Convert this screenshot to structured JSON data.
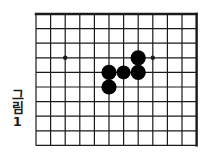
{
  "figure": {
    "caption": "그림1",
    "caption_label": "그림 1",
    "kind": "go-board-diagram",
    "background_color": "#ffffff",
    "line_color": "#1a1a1a",
    "stone_color": "#000000"
  },
  "board": {
    "origin_x": 36,
    "origin_y": 14,
    "cell_size_x": 14.6,
    "cell_size_y": 14.6,
    "columns": 12,
    "rows": 10,
    "grid_line_width": 1.2,
    "border_line_width": 2.4,
    "border_edges": [
      "top",
      "right"
    ],
    "column_indices": [
      0,
      1,
      2,
      3,
      4,
      5,
      6,
      7,
      8,
      9,
      10,
      11
    ],
    "row_indices": [
      0,
      1,
      2,
      3,
      4,
      5,
      6,
      7,
      8,
      9
    ]
  },
  "star_points": [
    {
      "name": "star-point-left",
      "col": 2,
      "row": 3,
      "radius": 2.2
    },
    {
      "name": "star-point-right",
      "col": 8,
      "row": 3,
      "radius": 2.2
    }
  ],
  "stones": [
    {
      "name": "stone-1",
      "color": "black",
      "col": 7,
      "row": 3,
      "radius": 7.6
    },
    {
      "name": "stone-2",
      "color": "black",
      "col": 5,
      "row": 4,
      "radius": 7.6
    },
    {
      "name": "stone-3",
      "color": "black",
      "col": 6,
      "row": 4,
      "radius": 7.0
    },
    {
      "name": "stone-4",
      "color": "black",
      "col": 7,
      "row": 4,
      "radius": 7.6
    },
    {
      "name": "stone-5",
      "color": "black",
      "col": 5,
      "row": 5,
      "radius": 7.6
    }
  ],
  "colors": {
    "ink": "#1a1a1a",
    "stone_black": "#000000",
    "paper": "#ffffff"
  }
}
